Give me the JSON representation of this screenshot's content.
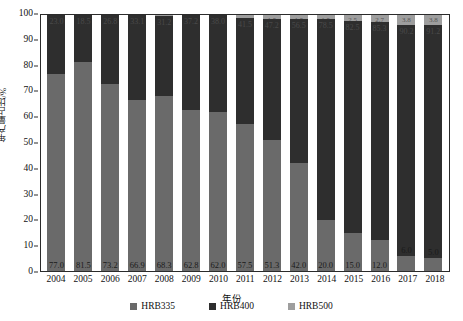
{
  "chart_data": {
    "type": "bar",
    "stacked": true,
    "title": "",
    "xlabel": "年份",
    "ylabel": "年产量占比/%",
    "ylim": [
      0,
      100
    ],
    "yticks": [
      0,
      10,
      20,
      30,
      40,
      50,
      60,
      70,
      80,
      90,
      100
    ],
    "grid": false,
    "legend_position": "bottom",
    "categories": [
      "2004",
      "2005",
      "2006",
      "2007",
      "2008",
      "2009",
      "2010",
      "2011",
      "2012",
      "2013",
      "2014",
      "2015",
      "2016",
      "2017",
      "2018"
    ],
    "series": [
      {
        "name": "HRB335",
        "color": "#6a6a6a",
        "values": [
          77.0,
          81.5,
          73.2,
          66.9,
          68.3,
          62.8,
          62.0,
          57.5,
          51.3,
          42.0,
          20.0,
          15.0,
          12.0,
          6.0,
          5.0
        ],
        "labels": [
          "77.0",
          "81.5",
          "73.2",
          "66.9",
          "68.3",
          "62.8",
          "62.0",
          "57.5",
          "51.3",
          "42.0",
          "20.0",
          "15.0",
          "12.0",
          "6.0",
          "5.0"
        ]
      },
      {
        "name": "HRB400",
        "color": "#2e2e2e",
        "values": [
          23.0,
          18.5,
          26.8,
          33.1,
          31.2,
          37.2,
          38.0,
          41.5,
          47.2,
          56.5,
          78.5,
          82.5,
          85.3,
          90.2,
          91.2
        ],
        "labels": [
          "23.0",
          "18.5",
          "26.8",
          "33.1",
          "31.2",
          "37.2",
          "38.0",
          "41.5",
          "47.2",
          "56.5",
          "78.5",
          "82.5",
          "85.3",
          "90.2",
          "91.2"
        ]
      },
      {
        "name": "HRB500",
        "color": "#9e9e9e",
        "values": [
          0.0,
          0.0,
          0.0,
          0.0,
          0.5,
          0.0,
          0.0,
          1.0,
          1.5,
          1.5,
          1.5,
          2.5,
          2.7,
          3.8,
          3.8
        ],
        "labels": [
          "0",
          "0",
          "0",
          "0",
          "0.5",
          "0",
          "0",
          "1.0",
          "1.5",
          "1.5",
          "1.5",
          "2.5",
          "2.7",
          "3.8",
          "3.8"
        ]
      }
    ]
  },
  "legend": {
    "items": [
      {
        "label": "HRB335",
        "color": "#6a6a6a"
      },
      {
        "label": "HRB400",
        "color": "#2e2e2e"
      },
      {
        "label": "HRB500",
        "color": "#9e9e9e"
      }
    ]
  }
}
